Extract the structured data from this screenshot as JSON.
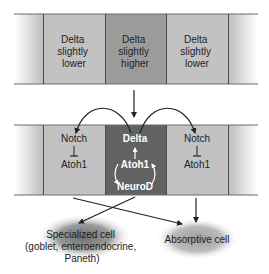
{
  "top_band": {
    "cells": [
      {
        "lines": [
          "Delta",
          "slightly",
          "lower"
        ]
      },
      {
        "lines": [
          "Delta",
          "slightly",
          "higher"
        ]
      },
      {
        "lines": [
          "Delta",
          "slightly",
          "lower"
        ]
      }
    ]
  },
  "bottom_band": {
    "left_cell": {
      "top": "Notch",
      "bottom": "Atoh1"
    },
    "center_cell": {
      "top": "Delta",
      "middle": "Atoh1",
      "bottom": "NeuroD"
    },
    "right_cell": {
      "top": "Notch",
      "bottom": "Atoh1"
    }
  },
  "outcomes": {
    "specialized": {
      "lines": [
        "Specialized cell",
        "(goblet, enteroendocrine,",
        "Paneth)"
      ]
    },
    "absorptive": {
      "label": "Absorptive cell"
    }
  },
  "colors": {
    "cell_light": "#c4c4c4",
    "cell_mid": "#9a9a9a",
    "cell_dark": "#6a6a6a",
    "border": "#4a4a4a",
    "arrow": "#222222"
  }
}
